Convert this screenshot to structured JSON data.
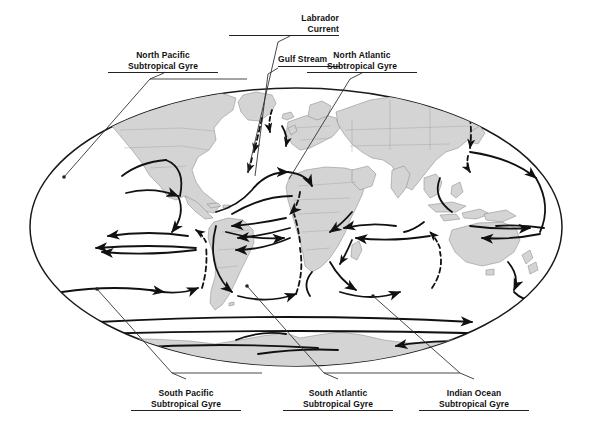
{
  "figure": {
    "kind": "world-map-diagram",
    "projection": "elliptical (Mollweide-like) world map",
    "colors": {
      "land_fill": "#d4d4d4",
      "land_border": "#8a8a8a",
      "ocean_fill": "#ffffff",
      "outline": "#1a1a1a",
      "current_arrow": "#111111",
      "leader_line": "#333333",
      "label_text": "#111111",
      "page_background": "#ffffff"
    }
  },
  "labels": {
    "north_pacific": {
      "line1": "North Pacific",
      "line2": "Subtropical Gyre"
    },
    "labrador": {
      "line1": "Labrador",
      "line2": "Current"
    },
    "gulf_stream": {
      "line1": "Gulf Stream"
    },
    "north_atlantic": {
      "line1": "North Atlantic",
      "line2": "Subtropical Gyre"
    },
    "south_pacific": {
      "line1": "South Pacific",
      "line2": "Subtropical Gyre"
    },
    "south_atlantic": {
      "line1": "South Atlantic",
      "line2": "Subtropical Gyre"
    },
    "indian_ocean": {
      "line1": "Indian Ocean",
      "line2": "Subtropical Gyre"
    }
  },
  "map_data": {
    "type": "map",
    "ellipse": {
      "cx": 296,
      "cy": 227,
      "rx": 266,
      "ry": 139
    },
    "callouts": [
      {
        "name": "north-pacific-subtropical-gyre",
        "label_x": 163,
        "label_y": 50,
        "anchor_x": 64,
        "anchor_y": 177,
        "align": "center"
      },
      {
        "name": "labrador-current",
        "label_x": 289,
        "label_y": 13,
        "anchor_x": 248,
        "anchor_y": 172,
        "align": "right"
      },
      {
        "name": "gulf-stream",
        "label_x": 278,
        "label_y": 54,
        "anchor_x": 255,
        "anchor_y": 176,
        "align": "left"
      },
      {
        "name": "north-atlantic-subtropical-gyre",
        "label_x": 358,
        "label_y": 50,
        "anchor_x": 289,
        "anchor_y": 179,
        "align": "center"
      },
      {
        "name": "south-pacific-subtropical-gyre",
        "label_x": 186,
        "label_y": 388,
        "anchor_x": 97,
        "anchor_y": 289,
        "align": "center"
      },
      {
        "name": "south-atlantic-subtropical-gyre",
        "label_x": 338,
        "label_y": 388,
        "anchor_x": 247,
        "anchor_y": 286,
        "align": "center"
      },
      {
        "name": "indian-ocean-subtropical-gyre",
        "label_x": 474,
        "label_y": 388,
        "anchor_x": 373,
        "anchor_y": 296,
        "align": "center"
      }
    ],
    "current_systems": [
      "North Pacific Subtropical Gyre (clockwise)",
      "North Atlantic Subtropical Gyre (clockwise)",
      "South Pacific Subtropical Gyre (counter-clockwise)",
      "South Atlantic Subtropical Gyre (counter-clockwise)",
      "Indian Ocean Subtropical Gyre (counter-clockwise)",
      "Gulf Stream",
      "Labrador Current (dashed, cold)",
      "Antarctic Circumpolar Current (eastward)",
      "Equatorial Counter Currents"
    ]
  }
}
